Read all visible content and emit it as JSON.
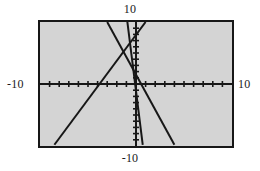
{
  "chart_data": {
    "type": "line",
    "title": "",
    "subtitle": "",
    "xlabel": "",
    "ylabel": "",
    "xlim": [
      -10,
      10
    ],
    "ylim": [
      -10,
      10
    ],
    "grid": false,
    "legend": false,
    "axis_labels": {
      "top": "10",
      "bottom": "-10",
      "left": "-10",
      "right": "10"
    },
    "tick_spacing": 1,
    "x_tick_values": [
      -9,
      -8,
      -7,
      -6,
      -5,
      -4,
      -3,
      -2,
      -1,
      1,
      2,
      3,
      4,
      5,
      6,
      7,
      8,
      9
    ],
    "y_tick_values": [
      -9,
      -8,
      -7,
      -6,
      -5,
      -4,
      -3,
      -2,
      -1,
      1,
      2,
      3,
      4,
      5,
      6,
      7,
      8,
      9
    ],
    "series": [
      {
        "name": "rising-line",
        "style": "solid",
        "color": "#171717",
        "points": [
          [
            -8.5,
            -9.8
          ],
          [
            1.0,
            10.0
          ]
        ],
        "slope": 2.08,
        "intercept": 7.9
      },
      {
        "name": "falling-line",
        "style": "solid",
        "color": "#171717",
        "points": [
          [
            -3.0,
            10.0
          ],
          [
            4.0,
            -9.8
          ]
        ],
        "slope": -2.83,
        "intercept": 1.5
      },
      {
        "name": "steep-line",
        "style": "solid",
        "color": "#171717",
        "points": [
          [
            -0.9,
            10.0
          ],
          [
            0.7,
            -9.8
          ]
        ],
        "slope": -12.4,
        "intercept": -0.8
      }
    ]
  },
  "colors": {
    "plot_background": "#d4d4d4",
    "page_background": "#ffffff",
    "axis": "#171717",
    "frame": "#171717",
    "text": "#1a1a1a"
  }
}
